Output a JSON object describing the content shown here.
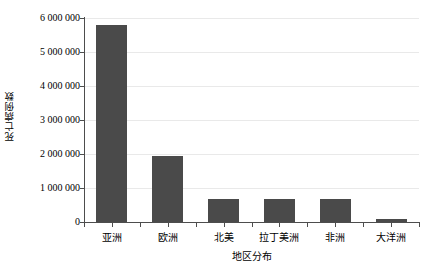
{
  "chart_data": {
    "type": "bar",
    "title": "",
    "xlabel": "地区分布",
    "ylabel": "死亡病例数",
    "categories": [
      "亚洲",
      "欧洲",
      "北美",
      "拉丁美洲",
      "非洲",
      "大洋洲"
    ],
    "values": [
      5790000,
      1930000,
      690000,
      690000,
      690000,
      80000
    ],
    "ylim": [
      0,
      6000000
    ],
    "ytick_values": [
      0,
      1000000,
      2000000,
      3000000,
      4000000,
      5000000,
      6000000
    ],
    "ytick_labels": [
      "0",
      "1 000 000",
      "2 000 000",
      "3 000 000",
      "4 000 000",
      "5 000 000",
      "6 000 000"
    ],
    "grid": true,
    "legend": false,
    "legend_position": "none",
    "series": [
      {
        "name": "死亡病例数",
        "values": [
          5790000,
          1930000,
          690000,
          690000,
          690000,
          80000
        ]
      }
    ]
  },
  "style": {
    "bar_color": "#4a4a4a",
    "gridline_color": "#e9e9e9",
    "axis_color": "#4d4d4d",
    "background": "#ffffff",
    "text_color": "#000000"
  }
}
